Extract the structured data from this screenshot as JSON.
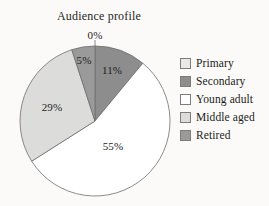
{
  "chart_data": {
    "type": "pie",
    "title": "Audience profile",
    "categories": [
      "Primary",
      "Secondary",
      "Young adult",
      "Middle aged",
      "Retired"
    ],
    "values": [
      0,
      11,
      55,
      29,
      5
    ],
    "labels": [
      "0%",
      "11%",
      "55%",
      "29%",
      "5%"
    ],
    "colors": [
      "#e8e8e6",
      "#8d8d8d",
      "#ffffff",
      "#dcdcda",
      "#9a9a9a"
    ],
    "legend_position": "right",
    "grid": false,
    "xlabel": "",
    "ylabel": "",
    "start_angle_deg": 0,
    "direction": "clockwise"
  },
  "title": "Audience profile",
  "legend": {
    "items": [
      {
        "label": "Primary",
        "color": "#e8e8e6"
      },
      {
        "label": "Secondary",
        "color": "#8d8d8d"
      },
      {
        "label": "Young adult",
        "color": "#ffffff"
      },
      {
        "label": "Middle aged",
        "color": "#dcdcda"
      },
      {
        "label": "Retired",
        "color": "#9a9a9a"
      }
    ]
  },
  "pie_labels": {
    "primary": "0%",
    "secondary": "11%",
    "young_adult": "55%",
    "middle_aged": "29%",
    "retired": "5%"
  }
}
